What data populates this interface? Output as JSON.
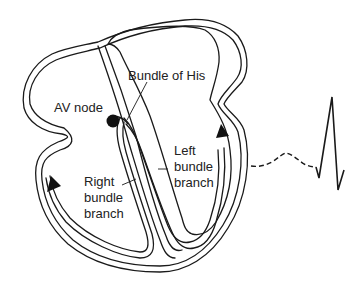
{
  "diagram": {
    "type": "heart-conduction-system",
    "labels": {
      "av_node": "AV node",
      "bundle_of_his": "Bundle of His",
      "left_bundle_branch": [
        "Left",
        "bundle",
        "branch"
      ],
      "right_bundle_branch": [
        "Right",
        "bundle",
        "branch"
      ]
    },
    "colors": {
      "line": "#1a1a1a",
      "text": "#222222",
      "background": "#ffffff"
    },
    "ecg": {
      "segments": [
        "P wave (dashed)",
        "QRS complex (solid)"
      ]
    }
  }
}
